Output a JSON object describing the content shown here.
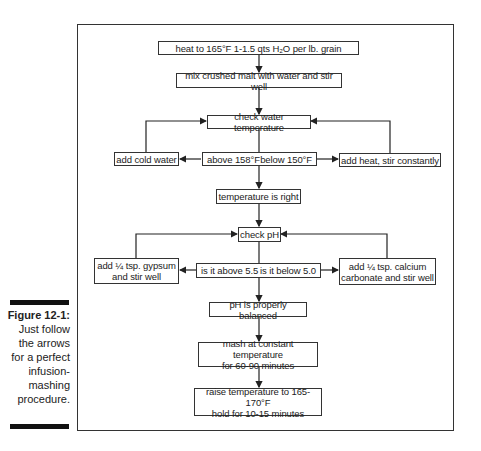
{
  "caption": {
    "figure_label": "Figure 12-1:",
    "text_lines": [
      "Just follow",
      "the arrows",
      "for a perfect",
      "infusion-",
      "mashing",
      "procedure."
    ]
  },
  "flowchart": {
    "nodes": {
      "heat": "heat to 165°F 1-1.5 qts H₂O per lb. grain",
      "mix": "mix crushed malt with water and stir well",
      "check_temp": "check water temperature",
      "add_cold": "add cold water",
      "above_158": "above 158°F",
      "below_150": "below 150°F",
      "add_heat": "add heat, stir constantly",
      "temp_right": "temperature is right",
      "check_ph": "check pH",
      "gypsum_line1": "add ¼ tsp. gypsum",
      "gypsum_line2": "and stir well",
      "above_55": "is it above 5.5",
      "below_50": "is it below 5.0",
      "calcium_line1": "add ¼ tsp. calcium",
      "calcium_line2": "carbonate and stir well",
      "ph_balanced": "pH is properly balanced",
      "mash_line1": "mash at constant temperature",
      "mash_line2": "for 60-90 minutes",
      "raise_line1": "raise temperature to 165-170°F",
      "raise_line2": "hold for 10-15 minutes"
    }
  }
}
